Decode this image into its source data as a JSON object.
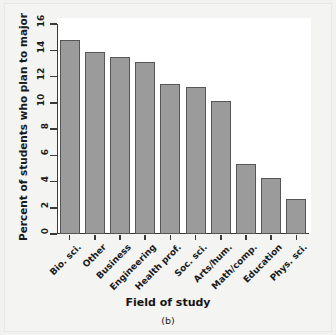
{
  "figure": {
    "caption": "(b)",
    "xlabel": "Field of study",
    "ylabel": "Percent of students who plan to major"
  },
  "colors": {
    "bar_fill": "#9b9b9b",
    "bar_edge": "#565656",
    "axis": "#3a3a3a",
    "plot_background": "#ffffff",
    "page_background": "#f2f2f0"
  },
  "chart_data": {
    "type": "bar",
    "title": "",
    "xlabel": "Field of study",
    "ylabel": "Percent of students who plan to major",
    "categories": [
      "Bio. sci.",
      "Other",
      "Business",
      "Engineering",
      "Health prof.",
      "Soc. sci.",
      "Arts/hum.",
      "Math/comp.",
      "Education",
      "Phys. sci."
    ],
    "values": [
      14.8,
      13.9,
      13.5,
      13.1,
      11.4,
      11.2,
      10.1,
      5.3,
      4.3,
      2.7
    ],
    "ylim": [
      0,
      16
    ],
    "yticks": [
      0,
      2,
      4,
      6,
      8,
      10,
      12,
      14,
      16
    ],
    "ytick_labels": [
      "0",
      "2",
      "4",
      "6",
      "8",
      "10",
      "12",
      "14",
      "16"
    ],
    "grid": false,
    "legend": null,
    "legend_position": "none",
    "xtick_label_rotation": -45
  }
}
